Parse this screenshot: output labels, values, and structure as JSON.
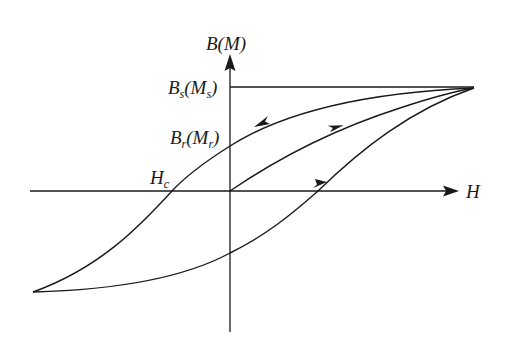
{
  "diagram": {
    "axes": {
      "y_label": {
        "main": "B",
        "paren": "M"
      },
      "x_label": "H"
    },
    "annotations": {
      "saturation": {
        "main": "B",
        "sub_main": "s",
        "paren": "M",
        "sub_paren": "s"
      },
      "remanence": {
        "main": "B",
        "sub_main": "r",
        "paren": "M",
        "sub_paren": "r"
      },
      "coercivity": {
        "main": "H",
        "sub_main": "c"
      }
    },
    "colors": {
      "stroke": "#1a1a1a",
      "background": "#ffffff"
    },
    "curves": [
      {
        "name": "initial-magnetization-curve",
        "from": "origin",
        "to": "saturation",
        "arrow": "toward saturation"
      },
      {
        "name": "descending-branch",
        "from": "saturation",
        "to": "negative-saturation",
        "arrow": "leftward",
        "crosses_y_at": "Br(Mr)",
        "crosses_x_at": "Hc"
      },
      {
        "name": "ascending-branch",
        "from": "negative-saturation",
        "to": "saturation",
        "arrow": "rightward"
      }
    ],
    "saturation_line": "horizontal line from B-axis at Bs(Ms) to saturation point"
  }
}
